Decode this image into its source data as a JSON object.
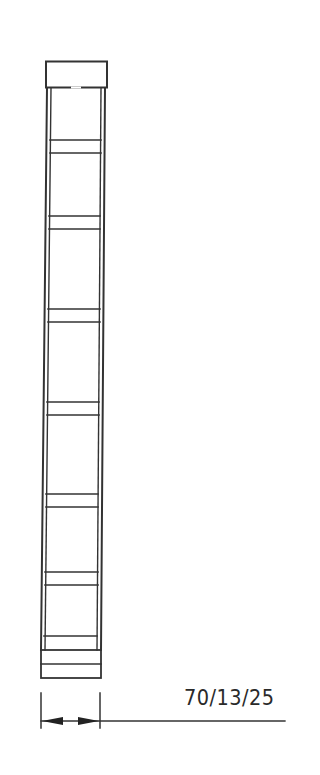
{
  "drawing": {
    "type": "bookcase-front-elevation",
    "stroke_color": "#333333",
    "background": "#ffffff",
    "shelf_count": 7,
    "components": [
      "top-cap",
      "left-side-panel",
      "right-side-panel",
      "shelves",
      "plinth",
      "width-dimension"
    ]
  },
  "dimension": {
    "label": "70/13/25"
  }
}
